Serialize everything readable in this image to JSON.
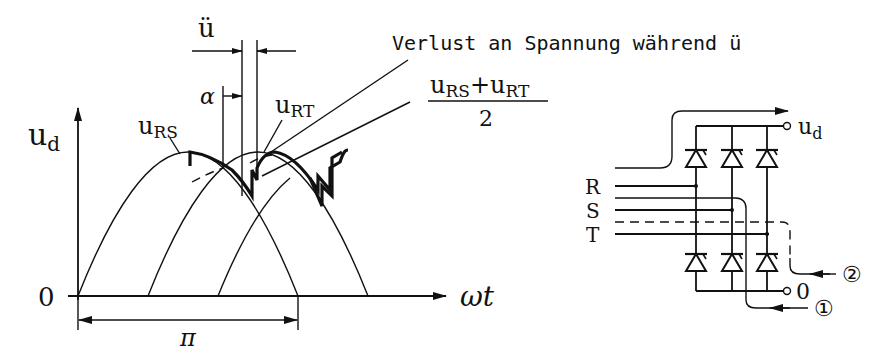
{
  "waveform": {
    "y_axis_label": "u",
    "y_axis_label_sub": "d",
    "x_axis_label": "ωt",
    "origin_label": "0",
    "period_label": "π",
    "overlap_label": "ü",
    "firing_angle_label": "α",
    "curve_label_rs": "u",
    "curve_label_rs_sub": "RS",
    "curve_label_rt": "u",
    "curve_label_rt_sub": "RT"
  },
  "annotations": {
    "voltage_loss": "Verlust an Spannung während ü",
    "average_numerator_u1": "u",
    "average_numerator_sub1": "RS",
    "average_plus": "+",
    "average_numerator_u2": "u",
    "average_numerator_sub2": "RT",
    "average_denominator": "2"
  },
  "circuit": {
    "phase_labels": [
      "R",
      "S",
      "T"
    ],
    "output_label": "u",
    "output_label_sub": "d",
    "zero_label": "0",
    "path_1_label": "①",
    "path_2_label": "②"
  }
}
